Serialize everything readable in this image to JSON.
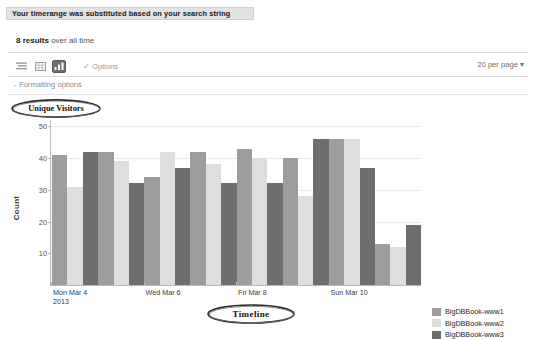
{
  "banner": {
    "message": "Your timerange was substituted based on your search string"
  },
  "results": {
    "count_text": "8 results",
    "scope_text": " over all time"
  },
  "toolbar": {
    "view_list_icon": "list-view-icon",
    "view_table_icon": "table-view-icon",
    "view_chart_icon": "chart-view-icon",
    "options_label": "Options",
    "options_check": "✓",
    "per_page_label": "20 per page",
    "per_page_caret": "▾"
  },
  "formatting": {
    "caret": "›",
    "label": "Formatting options"
  },
  "annotations": {
    "unique_visitors": "Unique Visitors",
    "timeline": "Timeline"
  },
  "chart_data": {
    "type": "bar",
    "title": "",
    "xlabel": "",
    "ylabel": "Count",
    "ylim": [
      0,
      52
    ],
    "yticks": [
      10,
      20,
      30,
      40,
      50
    ],
    "ytick_labels": [
      "10",
      "20",
      "30",
      "40",
      "50"
    ],
    "grid": true,
    "legend_position": "right",
    "categories": [
      "1",
      "2",
      "3",
      "4",
      "5",
      "6",
      "7",
      "8"
    ],
    "xtick_labels": [
      {
        "index": 0,
        "line1": "Mon Mar 4",
        "line2": "2013"
      },
      {
        "index": 2,
        "line1": "Wed Mar 6",
        "line2": ""
      },
      {
        "index": 4,
        "line1": "Fri Mar 8",
        "line2": ""
      },
      {
        "index": 6,
        "line1": "Sun Mar 10",
        "line2": ""
      }
    ],
    "series": [
      {
        "name": "BigDBBook-www1",
        "color": "#9d9d9d",
        "values": [
          41,
          42,
          34,
          42,
          43,
          40,
          46,
          13
        ]
      },
      {
        "name": "BigDBBook-www2",
        "color": "#dedede",
        "values": [
          31,
          39,
          42,
          38,
          40,
          28,
          46,
          12
        ]
      },
      {
        "name": "BigDBBook-www3",
        "color": "#6e6e6e",
        "values": [
          42,
          32,
          37,
          32,
          32,
          46,
          37,
          19
        ]
      }
    ]
  }
}
